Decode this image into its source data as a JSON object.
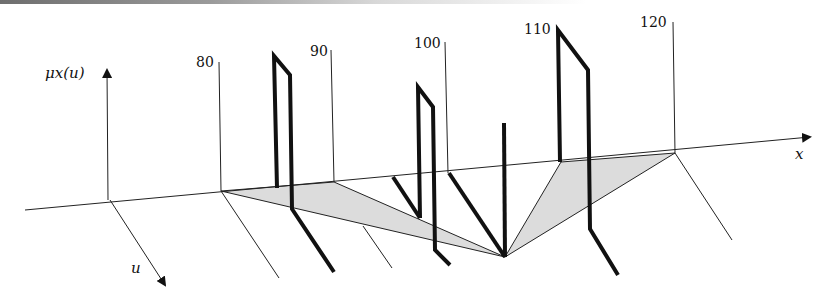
{
  "figure": {
    "type": "3d-fuzzy-membership-diagram",
    "axes": {
      "vertical": {
        "label": "μx(u)"
      },
      "horizontal": {
        "label": "x"
      },
      "depth": {
        "label": "u"
      }
    },
    "x_ticks": [
      "80",
      "90",
      "100",
      "110",
      "120"
    ]
  },
  "colors": {
    "line": "#111111",
    "shade": "#dcdcdc",
    "background": "#ffffff"
  }
}
